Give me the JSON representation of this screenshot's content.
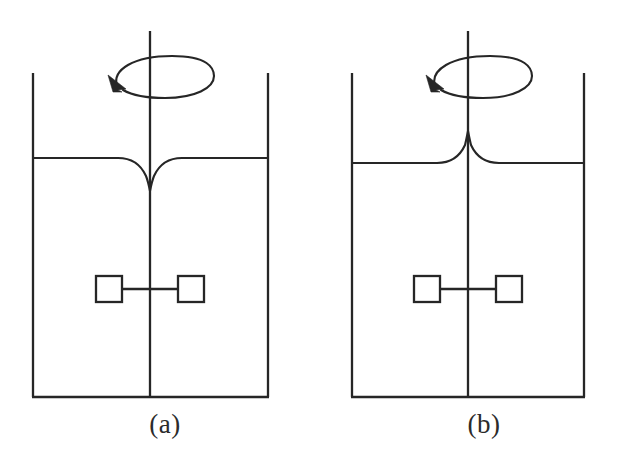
{
  "figure": {
    "type": "diagram",
    "background_color": "#ffffff",
    "line_color": "#262626"
  },
  "panels": [
    {
      "id": "panel-a",
      "label": "(a)",
      "surface_shape": "concave-vortex-dip",
      "surface_note": "free surface dips downward to a sharp point at the rotating shaft, forming a central vortex depression",
      "rotation_arrow": {
        "shape": "ellipse",
        "direction": "counterclockwise-viewed-from-above",
        "arrowhead_position": "lower-left"
      },
      "vessel": {
        "left_wall_x": 33,
        "right_wall_x": 268,
        "top_y": 73,
        "bottom_y": 397
      },
      "liquid_surface_y": 158,
      "shaft": {
        "x": 150,
        "top_y": 31,
        "bottom_y": 397
      },
      "impeller": {
        "blade_count": 2,
        "blade_shape": "square",
        "hub_y": 289,
        "blade_size": 26,
        "left_blade_x": 96,
        "right_blade_x": 178
      }
    },
    {
      "id": "panel-b",
      "label": "(b)",
      "surface_shape": "convex-central-peak",
      "surface_note": "free surface rises to a sharp cusp at the rotating shaft, forming a central peak",
      "rotation_arrow": {
        "shape": "ellipse",
        "direction": "counterclockwise-viewed-from-above",
        "arrowhead_position": "lower-left"
      },
      "vessel": {
        "left_wall_x": 352,
        "right_wall_x": 584,
        "top_y": 73,
        "bottom_y": 397
      },
      "liquid_surface_y": 163,
      "shaft": {
        "x": 468,
        "top_y": 31,
        "bottom_y": 397
      },
      "impeller": {
        "blade_count": 2,
        "blade_shape": "square",
        "hub_y": 289,
        "blade_size": 26,
        "left_blade_x": 414,
        "right_blade_x": 496
      }
    }
  ]
}
